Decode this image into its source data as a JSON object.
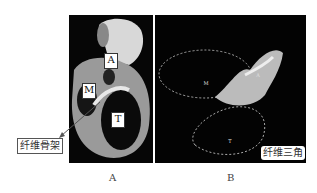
{
  "panels": [
    {
      "id": "A",
      "caption": "A",
      "labels": {
        "a": "A",
        "m": "M",
        "t": "T"
      },
      "callout": "纤维骨架"
    },
    {
      "id": "B",
      "caption": "B",
      "labels": {
        "m": "M",
        "a": "A",
        "t": "T"
      },
      "callout": "纤维三角"
    }
  ]
}
